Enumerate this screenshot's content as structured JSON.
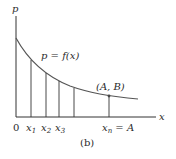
{
  "diagram": {
    "axes": {
      "y_label": "p",
      "x_label": "x",
      "origin_label": "0"
    },
    "curve": {
      "label": "p = f(x)"
    },
    "ticks": [
      {
        "base": "x",
        "sub": "1"
      },
      {
        "base": "x",
        "sub": "2"
      },
      {
        "base": "x",
        "sub": "3"
      },
      {
        "base": "x",
        "sub": "n",
        "suffix": " = A"
      }
    ],
    "point": {
      "label": "(A, B)"
    },
    "caption": "(b)",
    "colors": {
      "ink": "#2a2a2a",
      "curve": "#555555"
    }
  }
}
